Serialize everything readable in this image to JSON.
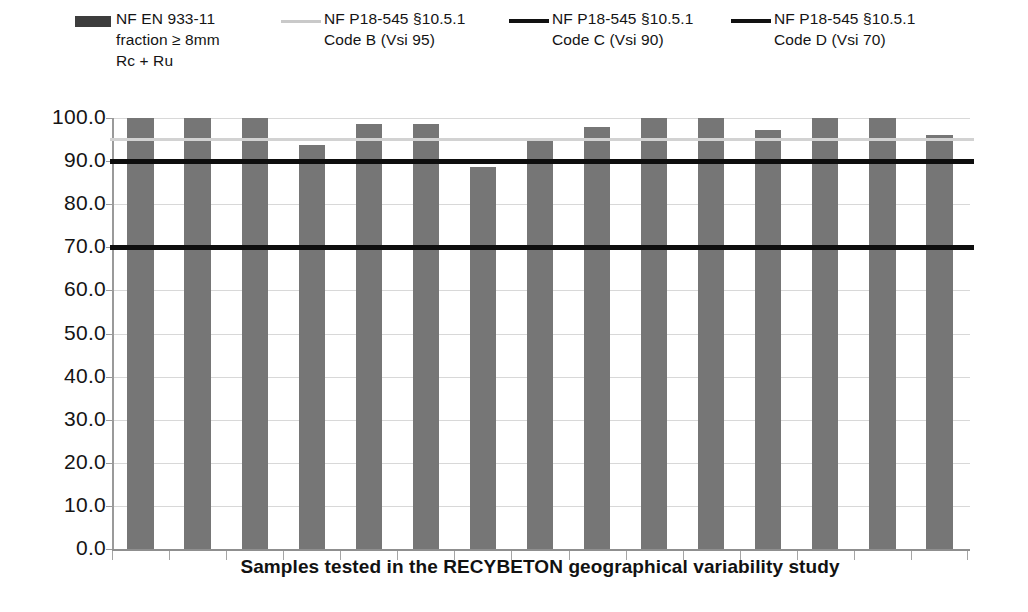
{
  "legend": {
    "items": [
      {
        "swatch": "filled-bar",
        "color": "#3d3d3d",
        "line1": "NF EN 933-11",
        "line2": "fraction ≥ 8mm",
        "line3": "Rc + Ru"
      },
      {
        "swatch": "light-line",
        "color": "#c9c9c9",
        "line1": "NF P18-545 §10.5.1",
        "line2": "Code B (Vsi 95)",
        "line3": ""
      },
      {
        "swatch": "dark-line",
        "color": "#111111",
        "line1": "NF P18-545 §10.5.1",
        "line2": "Code C (Vsi 90)",
        "line3": ""
      },
      {
        "swatch": "dark-line",
        "color": "#111111",
        "line1": "NF P18-545 §10.5.1",
        "line2": "Code D (Vsi 70)",
        "line3": ""
      }
    ]
  },
  "chart_data": {
    "type": "bar",
    "title": "",
    "subtitle": "",
    "xlabel": "Samples tested in the RECYBETON geographical variability study",
    "ylabel": "",
    "ylim": [
      0,
      100
    ],
    "ytick_labels": [
      "100.0",
      "90.0",
      "80.0",
      "70.0",
      "60.0",
      "50.0",
      "40.0",
      "30.0",
      "20.0",
      "10.0",
      "0.0"
    ],
    "ytick_values": [
      100,
      90,
      80,
      70,
      60,
      50,
      40,
      30,
      20,
      10,
      0
    ],
    "grid": true,
    "legend_position": "top",
    "categories": [
      "1",
      "2",
      "3",
      "4",
      "5",
      "6",
      "7",
      "8",
      "9",
      "10",
      "11",
      "12",
      "13",
      "14",
      "15"
    ],
    "series": [
      {
        "name": "NF EN 933-11 fraction ≥ 8mm Rc + Ru",
        "color": "#767676",
        "values": [
          100.0,
          100.0,
          100.0,
          93.8,
          98.5,
          98.5,
          88.7,
          95.3,
          98.0,
          100.0,
          100.0,
          97.3,
          100.0,
          100.0,
          96.0
        ]
      }
    ],
    "reference_lines": [
      {
        "name": "NF P18-545 §10.5.1 Code B (Vsi 95)",
        "value": 95,
        "color": "#d2d2d2",
        "width": 3
      },
      {
        "name": "NF P18-545 §10.5.1 Code C (Vsi 90)",
        "value": 90,
        "color": "#0e0e0e",
        "width": 5
      },
      {
        "name": "NF P18-545 §10.5.1 Code D (Vsi 70)",
        "value": 70,
        "color": "#0e0e0e",
        "width": 5
      }
    ]
  }
}
